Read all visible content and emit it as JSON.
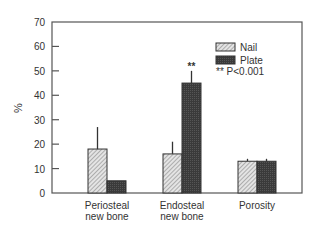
{
  "chart_data": {
    "type": "bar",
    "title": "",
    "xlabel": "",
    "ylabel": "%",
    "ylim": [
      0,
      70
    ],
    "yticks": [
      0,
      10,
      20,
      30,
      40,
      50,
      60,
      70
    ],
    "categories": [
      [
        "Periosteal",
        "new bone"
      ],
      [
        "Endosteal",
        "new bone"
      ],
      [
        "Porosity"
      ]
    ],
    "series": [
      {
        "name": "Nail",
        "pattern": "hatched",
        "values": [
          18,
          16,
          13
        ],
        "error_upper": [
          27,
          21,
          14
        ]
      },
      {
        "name": "Plate",
        "pattern": "dark",
        "values": [
          5,
          45,
          13
        ],
        "error_upper": [
          5,
          50,
          14
        ]
      }
    ],
    "annotations": [
      {
        "category_index": 1,
        "series": "Plate",
        "text": "**"
      }
    ],
    "legend": {
      "position": "top-right",
      "note": "** P<0.001"
    },
    "grid": false
  }
}
